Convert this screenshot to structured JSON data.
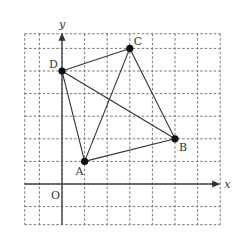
{
  "diagram": {
    "type": "coordinate-grid-quadrilateral",
    "axes": {
      "x_label": "x",
      "y_label": "y",
      "origin_label": "O"
    },
    "grid": {
      "x_range": [
        -2,
        7
      ],
      "y_range": [
        -2,
        7
      ],
      "dashed": true
    },
    "points": [
      {
        "name": "A",
        "x": 1,
        "y": 1
      },
      {
        "name": "B",
        "x": 5,
        "y": 2
      },
      {
        "name": "C",
        "x": 3,
        "y": 6
      },
      {
        "name": "D",
        "x": 0,
        "y": 5
      }
    ],
    "segments": [
      [
        "D",
        "C"
      ],
      [
        "C",
        "B"
      ],
      [
        "B",
        "A"
      ],
      [
        "A",
        "D"
      ],
      [
        "D",
        "B"
      ],
      [
        "A",
        "C"
      ]
    ]
  }
}
